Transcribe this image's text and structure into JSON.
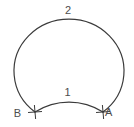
{
  "figure": {
    "type": "geometry-diagram",
    "labels": {
      "arc_major": "2",
      "arc_minor": "1",
      "point_left": "B",
      "point_right": "A"
    },
    "colors": {
      "stroke": "#3a3a3a",
      "text": "#4d4d4d",
      "background": "#ffffff"
    }
  }
}
